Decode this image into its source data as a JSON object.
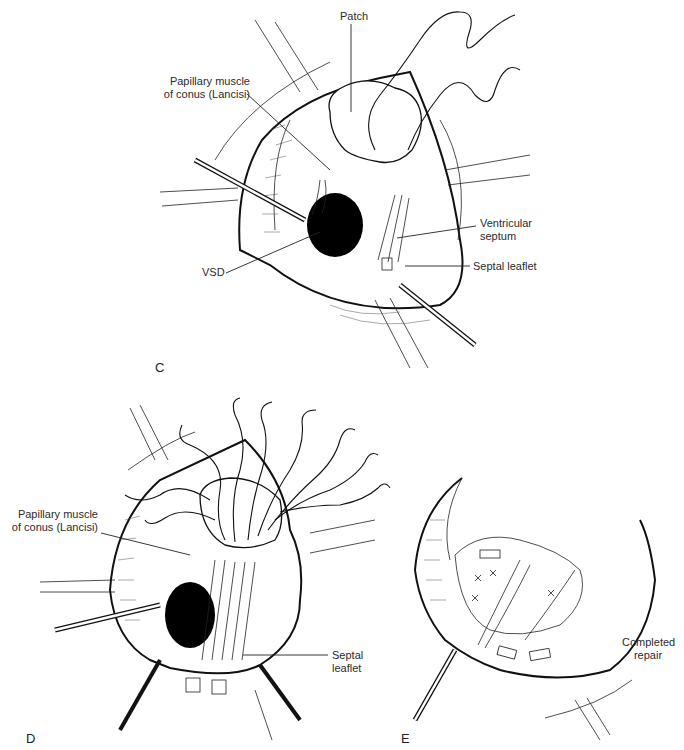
{
  "figure": {
    "panels": [
      {
        "id": "C",
        "letter": "C",
        "labels": {
          "patch": "Patch",
          "papillary_line1": "Papillary muscle",
          "papillary_line2": "of conus (Lancisi)",
          "ventricular_line1": "Ventricular",
          "ventricular_line2": "septum",
          "septal_leaflet": "Septal leaflet",
          "vsd": "VSD"
        }
      },
      {
        "id": "D",
        "letter": "D",
        "labels": {
          "papillary_line1": "Papillary muscle",
          "papillary_line2": "of conus (Lancisi)",
          "septal_line1": "Septal",
          "septal_line2": "leaflet"
        }
      },
      {
        "id": "E",
        "letter": "E",
        "labels": {
          "completed_line1": "Completed",
          "completed_line2": "repair"
        }
      }
    ]
  },
  "colors": {
    "ink": "#111111",
    "paper": "#ffffff",
    "label": "#2b2b2b"
  }
}
